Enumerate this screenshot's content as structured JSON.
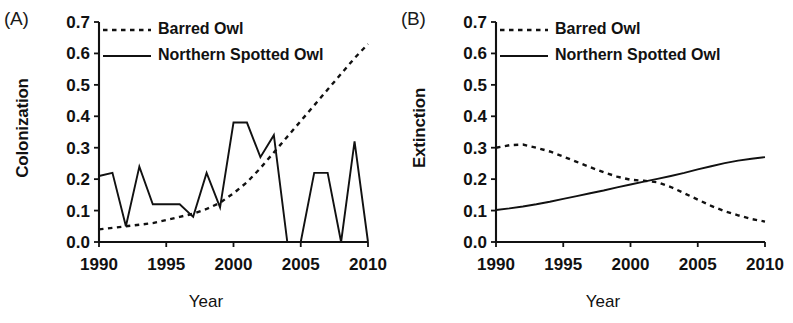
{
  "figure": {
    "xlabel": "Year",
    "panels": [
      {
        "label": "(A)",
        "ylabel": "Colonization"
      },
      {
        "label": "(B)",
        "ylabel": "Extinction"
      }
    ]
  },
  "legend": {
    "barred": "Barred Owl",
    "spotted": "Northern Spotted Owl"
  },
  "axis": {
    "yticks": [
      "0.0",
      "0.1",
      "0.2",
      "0.3",
      "0.4",
      "0.5",
      "0.6",
      "0.7"
    ],
    "xticks": [
      "1990",
      "1995",
      "2000",
      "2005",
      "2010"
    ]
  },
  "chart_data": [
    {
      "type": "line",
      "title": "(A)",
      "xlabel": "Year",
      "ylabel": "Colonization",
      "xlim": [
        1990,
        2010
      ],
      "ylim": [
        0.0,
        0.7
      ],
      "xticks": [
        1990,
        1995,
        2000,
        2005,
        2010
      ],
      "yticks": [
        0.0,
        0.1,
        0.2,
        0.3,
        0.4,
        0.5,
        0.6,
        0.7
      ],
      "grid": false,
      "legend_position": "top-left",
      "x": [
        1990,
        1991,
        1992,
        1993,
        1994,
        1995,
        1996,
        1997,
        1998,
        1999,
        2000,
        2001,
        2002,
        2003,
        2004,
        2005,
        2006,
        2007,
        2008,
        2009,
        2010
      ],
      "series": [
        {
          "name": "Barred Owl",
          "style": "dashed",
          "values": [
            0.04,
            0.045,
            0.05,
            0.055,
            0.06,
            0.07,
            0.08,
            0.09,
            0.105,
            0.125,
            0.155,
            0.19,
            0.235,
            0.285,
            0.335,
            0.385,
            0.435,
            0.485,
            0.535,
            0.585,
            0.63
          ]
        },
        {
          "name": "Northern Spotted Owl",
          "style": "solid",
          "values": [
            0.21,
            0.22,
            0.05,
            0.24,
            0.12,
            0.12,
            0.12,
            0.08,
            0.22,
            0.11,
            0.38,
            0.38,
            0.27,
            0.34,
            0.0,
            0.0,
            0.22,
            0.22,
            0.0,
            0.32,
            0.0
          ]
        }
      ]
    },
    {
      "type": "line",
      "title": "(B)",
      "xlabel": "Year",
      "ylabel": "Extinction",
      "xlim": [
        1990,
        2010
      ],
      "ylim": [
        0.0,
        0.7
      ],
      "xticks": [
        1990,
        1995,
        2000,
        2005,
        2010
      ],
      "yticks": [
        0.0,
        0.1,
        0.2,
        0.3,
        0.4,
        0.5,
        0.6,
        0.7
      ],
      "grid": false,
      "legend_position": "top-left",
      "x": [
        1990,
        1991,
        1992,
        1993,
        1994,
        1995,
        1996,
        1997,
        1998,
        1999,
        2000,
        2001,
        2002,
        2003,
        2004,
        2005,
        2006,
        2007,
        2008,
        2009,
        2010
      ],
      "series": [
        {
          "name": "Barred Owl",
          "style": "dashed",
          "values": [
            0.3,
            0.308,
            0.31,
            0.3,
            0.288,
            0.272,
            0.255,
            0.238,
            0.222,
            0.208,
            0.198,
            0.195,
            0.19,
            0.175,
            0.155,
            0.135,
            0.115,
            0.098,
            0.085,
            0.073,
            0.065
          ]
        },
        {
          "name": "Northern Spotted Owl",
          "style": "solid",
          "values": [
            0.102,
            0.107,
            0.113,
            0.12,
            0.128,
            0.137,
            0.146,
            0.155,
            0.164,
            0.174,
            0.183,
            0.192,
            0.201,
            0.21,
            0.22,
            0.231,
            0.241,
            0.251,
            0.259,
            0.265,
            0.27
          ]
        }
      ]
    }
  ]
}
